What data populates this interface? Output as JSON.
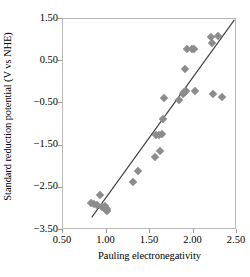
{
  "chart_data": {
    "type": "scatter",
    "title": "",
    "xlabel": "Pauling electronegativity",
    "ylabel": "Standard reduction potential (V vs NHE)",
    "xlim": [
      0.5,
      2.5
    ],
    "ylim": [
      -3.5,
      1.5
    ],
    "xticks": [
      "0.50",
      "1.00",
      "1.50",
      "2.00",
      "2.50"
    ],
    "xtick_values": [
      0.5,
      1.0,
      1.5,
      2.0,
      2.5
    ],
    "yticks": [
      "1.50",
      "0.50",
      "−0.50",
      "−1.50",
      "−2.50",
      "−3.50"
    ],
    "ytick_values": [
      1.5,
      0.5,
      -0.5,
      -1.5,
      -2.5,
      -3.5
    ],
    "grid": false,
    "legend": null,
    "marker": {
      "shape": "diamond",
      "color": "#8c8c8c",
      "size": 6
    },
    "trendline": {
      "type": "linear",
      "color": "#3a3a3a",
      "x_start": 0.83,
      "y_start": -3.2,
      "x_end": 2.47,
      "y_end": 1.48
    },
    "points": [
      {
        "x": 0.82,
        "y": -2.86
      },
      {
        "x": 0.86,
        "y": -2.88
      },
      {
        "x": 0.89,
        "y": -2.9
      },
      {
        "x": 0.93,
        "y": -2.66
      },
      {
        "x": 0.95,
        "y": -2.95
      },
      {
        "x": 0.98,
        "y": -2.94
      },
      {
        "x": 0.99,
        "y": -3.03
      },
      {
        "x": 1.0,
        "y": -3.05
      },
      {
        "x": 1.01,
        "y": -3.0
      },
      {
        "x": 1.31,
        "y": -2.37
      },
      {
        "x": 1.36,
        "y": -2.1
      },
      {
        "x": 1.56,
        "y": -1.78
      },
      {
        "x": 1.57,
        "y": -1.26
      },
      {
        "x": 1.6,
        "y": -1.25
      },
      {
        "x": 1.61,
        "y": -1.62
      },
      {
        "x": 1.64,
        "y": -1.22
      },
      {
        "x": 1.65,
        "y": -0.87
      },
      {
        "x": 1.66,
        "y": -0.37
      },
      {
        "x": 1.83,
        "y": -0.43
      },
      {
        "x": 1.88,
        "y": -0.27
      },
      {
        "x": 1.89,
        "y": -0.24
      },
      {
        "x": 1.9,
        "y": -0.22
      },
      {
        "x": 1.91,
        "y": -0.2
      },
      {
        "x": 1.9,
        "y": 0.31
      },
      {
        "x": 1.93,
        "y": 0.78
      },
      {
        "x": 1.98,
        "y": 0.79
      },
      {
        "x": 2.0,
        "y": 0.8
      },
      {
        "x": 2.02,
        "y": -0.2
      },
      {
        "x": 2.2,
        "y": 1.07
      },
      {
        "x": 2.21,
        "y": 0.93
      },
      {
        "x": 2.22,
        "y": -0.28
      },
      {
        "x": 2.28,
        "y": 1.1
      },
      {
        "x": 2.33,
        "y": -0.35
      }
    ]
  }
}
